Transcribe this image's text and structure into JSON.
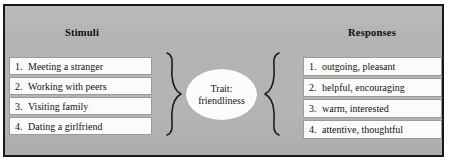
{
  "figure": {
    "background_color": "#b4b4b4",
    "border_color": "#19191a",
    "box_fill_color": "#fbfbfa",
    "box_border_color": "#9a9a9a"
  },
  "stimuli": {
    "heading": "Stimuli",
    "items": [
      {
        "number": "1.",
        "text": "Meeting a stranger"
      },
      {
        "number": "2.",
        "text": "Working with peers"
      },
      {
        "number": "3.",
        "text": "Visiting family"
      },
      {
        "number": "4.",
        "text": "Dating a girlfriend"
      }
    ]
  },
  "centre": {
    "brace_left_icon": "right-curly-brace-icon",
    "brace_right_icon": "left-curly-brace-icon",
    "trait_line1": "Trait:",
    "trait_line2": "friendliness"
  },
  "responses": {
    "heading": "Responses",
    "items": [
      {
        "number": "1.",
        "text": "outgoing, pleasant"
      },
      {
        "number": "2.",
        "text": "helpful, encouraging"
      },
      {
        "number": "3.",
        "text": "warm, interested"
      },
      {
        "number": "4.",
        "text": "attentive, thoughtful"
      }
    ]
  }
}
